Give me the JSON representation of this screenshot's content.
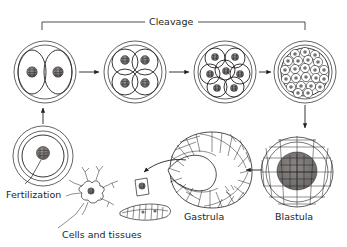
{
  "figure": {
    "background_color": "#ffffff",
    "ink_color": "#231f20",
    "nucleus_color": "#6f6c6a"
  },
  "labels": {
    "cleavage": "Cleavage",
    "fertilization": "Fertilization",
    "cells_and_tissues": "Cells and tissues",
    "gastrula": "Gastrula",
    "blastula": "Blastula"
  },
  "bracket": {
    "label": "Cleavage",
    "x_start": 42,
    "x_end": 305,
    "y": 22
  },
  "stages": [
    {
      "id": "zygote",
      "name": "Fertilized egg (zygote)",
      "label": "Fertilization",
      "cell_count": 1,
      "cx": 43,
      "cy": 156,
      "r": 30
    },
    {
      "id": "two-cell",
      "name": "Two-cell stage",
      "cell_count": 2,
      "cx": 45,
      "cy": 72,
      "r": 31
    },
    {
      "id": "four-cell",
      "name": "Four-cell stage",
      "cell_count": 4,
      "cx": 135,
      "cy": 72,
      "r": 31
    },
    {
      "id": "eight-cell",
      "name": "Eight-cell stage",
      "cell_count": 8,
      "cx": 225,
      "cy": 72,
      "r": 31
    },
    {
      "id": "morula",
      "name": "Morula",
      "cell_count": 32,
      "cx": 305,
      "cy": 72,
      "r": 31
    },
    {
      "id": "blastula",
      "name": "Blastula",
      "label": "Blastula",
      "cx": 297,
      "cy": 172,
      "r": 36
    },
    {
      "id": "gastrula",
      "name": "Gastrula",
      "label": "Gastrula",
      "cx": 207,
      "cy": 170
    },
    {
      "id": "cells-tissues",
      "name": "Differentiated cells and tissues",
      "label": "Cells and tissues",
      "components": [
        "neuron",
        "epithelial-cell",
        "muscle-cell"
      ]
    }
  ],
  "arrows": [
    {
      "id": "zygote-to-two-cell",
      "from": "zygote",
      "to": "two-cell",
      "direction": "up"
    },
    {
      "id": "two-to-four",
      "from": "two-cell",
      "to": "four-cell",
      "direction": "right"
    },
    {
      "id": "four-to-eight",
      "from": "four-cell",
      "to": "eight-cell",
      "direction": "right"
    },
    {
      "id": "eight-to-morula",
      "from": "eight-cell",
      "to": "morula",
      "direction": "right"
    },
    {
      "id": "morula-to-blastula",
      "from": "morula",
      "to": "blastula",
      "direction": "down"
    },
    {
      "id": "blastula-to-gastrula",
      "from": "blastula",
      "to": "gastrula",
      "direction": "left"
    },
    {
      "id": "gastrula-to-cells",
      "from": "gastrula",
      "to": "cells-tissues",
      "direction": "curved-left"
    }
  ]
}
